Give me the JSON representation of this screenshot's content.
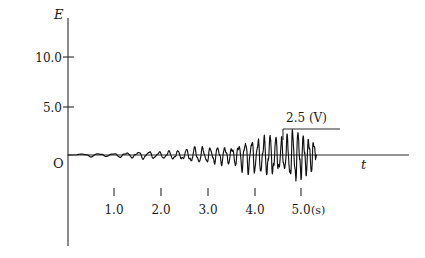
{
  "chart_data": {
    "type": "line",
    "title": "",
    "xlabel": "t",
    "ylabel": "E",
    "x_unit": "(s)",
    "origin_label": "O",
    "grid": false,
    "legend": "none",
    "xlim": [
      0,
      7.3
    ],
    "ylim": [
      -5.0,
      15.0
    ],
    "y_ticks": [
      10.0,
      5.0
    ],
    "y_tick_labels": [
      "10.0",
      "5.0"
    ],
    "x_ticks": [
      1.0,
      2.0,
      3.0,
      4.0,
      5.0
    ],
    "x_tick_labels": [
      "1.0",
      "2.0",
      "3.0",
      "4.0",
      "5.0"
    ],
    "annotations": [
      {
        "name": "peak-amplitude-callout",
        "text": "2.5 (V)",
        "value": 2.5,
        "unit": "V",
        "at_x": 4.7,
        "at_y": 2.5
      }
    ],
    "series": [
      {
        "name": "E(t) seismic oscillation",
        "description": "growing-amplitude oscillation, envelope rises from ~0.1 V at t=0.2 s to ~2.5 V at t=4.7 s, signal ends at t=5.3 s",
        "envelope_start_t": 0.2,
        "envelope_end_t": 5.3,
        "envelope_start_amp": 0.12,
        "envelope_peak_amp": 2.5
      }
    ]
  },
  "axes": {
    "y_name": "E",
    "x_name": "t"
  }
}
